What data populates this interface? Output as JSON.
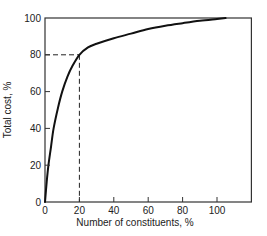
{
  "chart_data": {
    "type": "line",
    "title": "",
    "xlabel": "Number of constituents, %",
    "ylabel": "Total cost, %",
    "xlim": [
      0,
      120
    ],
    "ylim": [
      0,
      100
    ],
    "grid": false,
    "legend": null,
    "xticks": [
      0,
      20,
      40,
      60,
      80,
      100
    ],
    "yticks": [
      0,
      20,
      40,
      60,
      80,
      100
    ],
    "xtick_labels": [
      "0",
      "20",
      "40",
      "60",
      "80",
      "100"
    ],
    "ytick_labels": [
      "0",
      "20",
      "40",
      "60",
      "80",
      "100"
    ],
    "series": [
      {
        "name": "Cumulative total cost",
        "style": "solid",
        "color": "#111111",
        "x": [
          0,
          1,
          2,
          3.5,
          5,
          7.5,
          10,
          13,
          16,
          20,
          25,
          30,
          40,
          50,
          60,
          70,
          80,
          90,
          100,
          105
        ],
        "y": [
          0,
          11,
          20,
          30,
          40,
          51,
          60,
          68,
          74,
          80,
          84,
          86,
          89,
          91.5,
          94,
          95.8,
          97.2,
          98.5,
          99.5,
          100
        ]
      }
    ],
    "annotations": [
      {
        "type": "dashed-guide",
        "description": "Dashed reference lines marking the point where 20% of constituents account for 80% of total cost",
        "point": [
          20,
          80
        ]
      }
    ]
  },
  "colors": {
    "axis": "#333333",
    "curve": "#111111",
    "text": "#222222",
    "background": "#ffffff"
  }
}
